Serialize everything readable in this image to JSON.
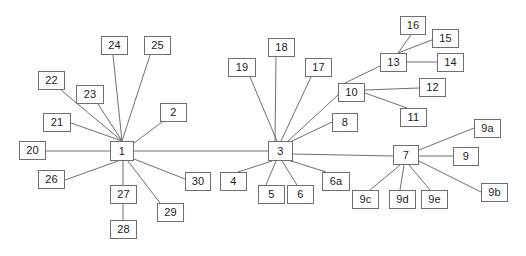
{
  "diagram": {
    "type": "node-link-tree",
    "width": 526,
    "height": 256,
    "style": {
      "background": "#ffffff",
      "node_border": "#6e6e6e",
      "node_fill": "#ffffff",
      "edge_color": "#6e6e6e",
      "label_color": "#1a1a1a"
    },
    "nodes": [
      {
        "id": "1",
        "label": "1",
        "x": 110,
        "y": 141,
        "w": 24,
        "h": 20
      },
      {
        "id": "2",
        "label": "2",
        "x": 160,
        "y": 103,
        "w": 27,
        "h": 19
      },
      {
        "id": "3",
        "label": "3",
        "x": 268,
        "y": 141,
        "w": 25,
        "h": 20
      },
      {
        "id": "4",
        "label": "4",
        "x": 220,
        "y": 172,
        "w": 27,
        "h": 19
      },
      {
        "id": "5",
        "label": "5",
        "x": 258,
        "y": 185,
        "w": 27,
        "h": 19
      },
      {
        "id": "6",
        "label": "6",
        "x": 287,
        "y": 185,
        "w": 27,
        "h": 19
      },
      {
        "id": "6a",
        "label": "6a",
        "x": 322,
        "y": 172,
        "w": 28,
        "h": 19
      },
      {
        "id": "7",
        "label": "7",
        "x": 393,
        "y": 145,
        "w": 26,
        "h": 20
      },
      {
        "id": "8",
        "label": "8",
        "x": 332,
        "y": 113,
        "w": 26,
        "h": 19
      },
      {
        "id": "9",
        "label": "9",
        "x": 453,
        "y": 147,
        "w": 26,
        "h": 19
      },
      {
        "id": "9a",
        "label": "9a",
        "x": 474,
        "y": 119,
        "w": 27,
        "h": 19
      },
      {
        "id": "9b",
        "label": "9b",
        "x": 481,
        "y": 183,
        "w": 27,
        "h": 19
      },
      {
        "id": "9c",
        "label": "9c",
        "x": 352,
        "y": 190,
        "w": 27,
        "h": 19
      },
      {
        "id": "9d",
        "label": "9d",
        "x": 389,
        "y": 190,
        "w": 27,
        "h": 19
      },
      {
        "id": "9e",
        "label": "9e",
        "x": 421,
        "y": 190,
        "w": 27,
        "h": 19
      },
      {
        "id": "10",
        "label": "10",
        "x": 338,
        "y": 83,
        "w": 27,
        "h": 19
      },
      {
        "id": "11",
        "label": "11",
        "x": 400,
        "y": 108,
        "w": 27,
        "h": 19
      },
      {
        "id": "12",
        "label": "12",
        "x": 419,
        "y": 78,
        "w": 27,
        "h": 19
      },
      {
        "id": "13",
        "label": "13",
        "x": 380,
        "y": 53,
        "w": 27,
        "h": 19
      },
      {
        "id": "14",
        "label": "14",
        "x": 437,
        "y": 53,
        "w": 27,
        "h": 19
      },
      {
        "id": "15",
        "label": "15",
        "x": 432,
        "y": 29,
        "w": 27,
        "h": 19
      },
      {
        "id": "16",
        "label": "16",
        "x": 400,
        "y": 16,
        "w": 26,
        "h": 19
      },
      {
        "id": "17",
        "label": "17",
        "x": 305,
        "y": 58,
        "w": 27,
        "h": 19
      },
      {
        "id": "18",
        "label": "18",
        "x": 268,
        "y": 38,
        "w": 27,
        "h": 19
      },
      {
        "id": "19",
        "label": "19",
        "x": 228,
        "y": 58,
        "w": 28,
        "h": 19
      },
      {
        "id": "20",
        "label": "20",
        "x": 19,
        "y": 141,
        "w": 27,
        "h": 19
      },
      {
        "id": "21",
        "label": "21",
        "x": 43,
        "y": 113,
        "w": 28,
        "h": 19
      },
      {
        "id": "22",
        "label": "22",
        "x": 38,
        "y": 71,
        "w": 27,
        "h": 19
      },
      {
        "id": "23",
        "label": "23",
        "x": 76,
        "y": 85,
        "w": 28,
        "h": 19
      },
      {
        "id": "24",
        "label": "24",
        "x": 101,
        "y": 36,
        "w": 27,
        "h": 19
      },
      {
        "id": "25",
        "label": "25",
        "x": 144,
        "y": 36,
        "w": 27,
        "h": 19
      },
      {
        "id": "26",
        "label": "26",
        "x": 38,
        "y": 170,
        "w": 27,
        "h": 19
      },
      {
        "id": "27",
        "label": "27",
        "x": 110,
        "y": 185,
        "w": 27,
        "h": 19
      },
      {
        "id": "28",
        "label": "28",
        "x": 110,
        "y": 220,
        "w": 27,
        "h": 19
      },
      {
        "id": "29",
        "label": "29",
        "x": 157,
        "y": 203,
        "w": 27,
        "h": 19
      },
      {
        "id": "30",
        "label": "30",
        "x": 185,
        "y": 172,
        "w": 26,
        "h": 19
      }
    ],
    "edges": [
      {
        "from": "20",
        "to": "1",
        "x1": 46,
        "y1": 151,
        "x2": 110,
        "y2": 151
      },
      {
        "from": "21",
        "to": "1",
        "x1": 71,
        "y1": 123,
        "x2": 122,
        "y2": 141
      },
      {
        "from": "22",
        "to": "1",
        "x1": 61,
        "y1": 90,
        "x2": 122,
        "y2": 141
      },
      {
        "from": "23",
        "to": "1",
        "x1": 98,
        "y1": 104,
        "x2": 122,
        "y2": 141
      },
      {
        "from": "24",
        "to": "1",
        "x1": 113,
        "y1": 55,
        "x2": 122,
        "y2": 141
      },
      {
        "from": "25",
        "to": "1",
        "x1": 150,
        "y1": 55,
        "x2": 122,
        "y2": 141
      },
      {
        "from": "2",
        "to": "1",
        "x1": 162,
        "y1": 122,
        "x2": 134,
        "y2": 143
      },
      {
        "from": "26",
        "to": "1",
        "x1": 65,
        "y1": 180,
        "x2": 118,
        "y2": 161
      },
      {
        "from": "27",
        "to": "1",
        "x1": 123,
        "y1": 185,
        "x2": 123,
        "y2": 161
      },
      {
        "from": "27",
        "to": "28",
        "x1": 123,
        "y1": 204,
        "x2": 123,
        "y2": 220
      },
      {
        "from": "29",
        "to": "1",
        "x1": 160,
        "y1": 203,
        "x2": 128,
        "y2": 161
      },
      {
        "from": "30",
        "to": "1",
        "x1": 185,
        "y1": 179,
        "x2": 134,
        "y2": 159
      },
      {
        "from": "1",
        "to": "3",
        "x1": 134,
        "y1": 151,
        "x2": 268,
        "y2": 151
      },
      {
        "from": "19",
        "to": "3",
        "x1": 250,
        "y1": 77,
        "x2": 277,
        "y2": 141
      },
      {
        "from": "18",
        "to": "3",
        "x1": 276,
        "y1": 57,
        "x2": 275,
        "y2": 141
      },
      {
        "from": "17",
        "to": "3",
        "x1": 311,
        "y1": 77,
        "x2": 281,
        "y2": 141
      },
      {
        "from": "8",
        "to": "3",
        "x1": 332,
        "y1": 122,
        "x2": 288,
        "y2": 143
      },
      {
        "from": "10",
        "to": "3",
        "x1": 338,
        "y1": 95,
        "x2": 287,
        "y2": 142
      },
      {
        "from": "4",
        "to": "3",
        "x1": 238,
        "y1": 172,
        "x2": 272,
        "y2": 161
      },
      {
        "from": "5",
        "to": "3",
        "x1": 266,
        "y1": 185,
        "x2": 276,
        "y2": 161
      },
      {
        "from": "6",
        "to": "3",
        "x1": 297,
        "y1": 185,
        "x2": 282,
        "y2": 161
      },
      {
        "from": "6a",
        "to": "3",
        "x1": 326,
        "y1": 172,
        "x2": 288,
        "y2": 160
      },
      {
        "from": "3",
        "to": "7",
        "x1": 293,
        "y1": 154,
        "x2": 393,
        "y2": 156
      },
      {
        "from": "10",
        "to": "13",
        "x1": 345,
        "y1": 83,
        "x2": 380,
        "y2": 66
      },
      {
        "from": "10",
        "to": "12",
        "x1": 365,
        "y1": 90,
        "x2": 419,
        "y2": 88
      },
      {
        "from": "10",
        "to": "11",
        "x1": 365,
        "y1": 93,
        "x2": 407,
        "y2": 108
      },
      {
        "from": "13",
        "to": "16",
        "x1": 398,
        "y1": 53,
        "x2": 411,
        "y2": 35
      },
      {
        "from": "13",
        "to": "15",
        "x1": 398,
        "y1": 53,
        "x2": 437,
        "y2": 38
      },
      {
        "from": "13",
        "to": "14",
        "x1": 407,
        "y1": 62,
        "x2": 437,
        "y2": 62
      },
      {
        "from": "7",
        "to": "9a",
        "x1": 419,
        "y1": 150,
        "x2": 474,
        "y2": 128
      },
      {
        "from": "7",
        "to": "9",
        "x1": 419,
        "y1": 156,
        "x2": 453,
        "y2": 156
      },
      {
        "from": "7",
        "to": "9b",
        "x1": 419,
        "y1": 161,
        "x2": 481,
        "y2": 192
      },
      {
        "from": "7",
        "to": "9c",
        "x1": 400,
        "y1": 165,
        "x2": 370,
        "y2": 190
      },
      {
        "from": "7",
        "to": "9d",
        "x1": 404,
        "y1": 165,
        "x2": 400,
        "y2": 190
      },
      {
        "from": "7",
        "to": "9e",
        "x1": 409,
        "y1": 165,
        "x2": 430,
        "y2": 190
      }
    ]
  }
}
